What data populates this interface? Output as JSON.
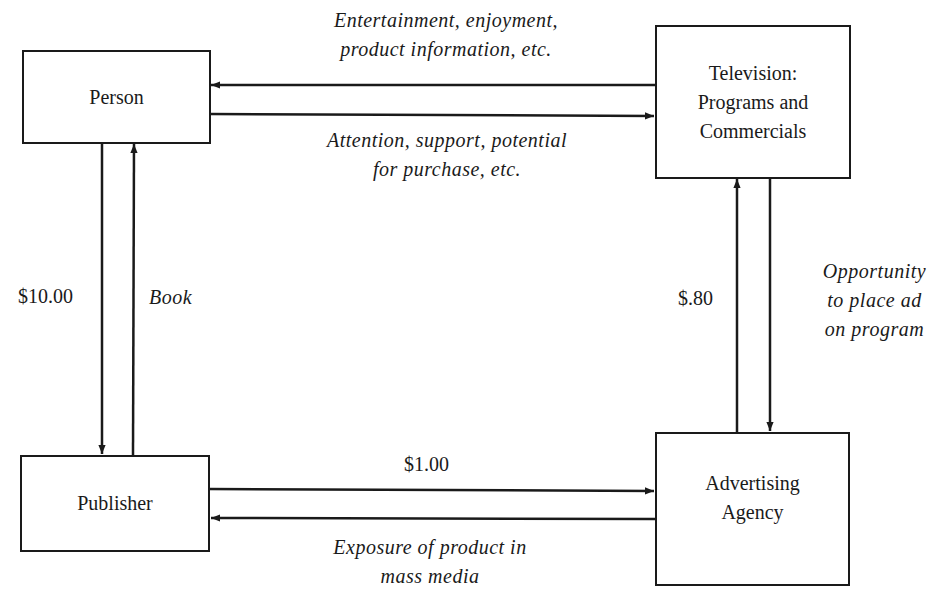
{
  "diagram": {
    "type": "flow",
    "nodes": {
      "person": {
        "label": "Person"
      },
      "television": {
        "line1": "Television:",
        "line2": "Programs and",
        "line3": "Commercials"
      },
      "publisher": {
        "label": "Publisher"
      },
      "agency": {
        "line1": "Advertising",
        "line2": "Agency"
      }
    },
    "edges": {
      "tv_to_person": {
        "line1": "Entertainment, enjoyment,",
        "line2": "product information, etc."
      },
      "person_to_tv": {
        "line1": "Attention, support, potential",
        "line2": "for purchase, etc."
      },
      "person_to_publisher": {
        "label": "$10.00"
      },
      "publisher_to_person": {
        "label": "Book"
      },
      "publisher_to_agency": {
        "label": "$1.00"
      },
      "agency_to_publisher": {
        "line1": "Exposure of product in",
        "line2": "mass media"
      },
      "agency_to_tv": {
        "label": "$.80"
      },
      "tv_to_agency": {
        "line1": "Opportunity",
        "line2": "to place ad",
        "line3": "on program"
      }
    },
    "colors": {
      "stroke": "#1a1a1a",
      "background": "#ffffff"
    }
  }
}
